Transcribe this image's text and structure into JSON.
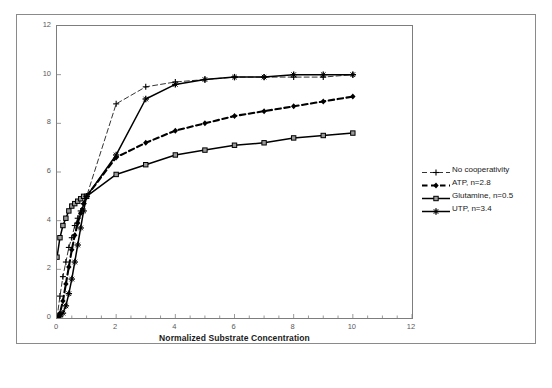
{
  "chart_data": {
    "type": "line",
    "title": "",
    "xlabel": "Normalized Substrate Concentration",
    "ylabel": "",
    "xlim": [
      0,
      12
    ],
    "ylim": [
      0,
      12
    ],
    "xticks": [
      0,
      2,
      4,
      6,
      8,
      10,
      12
    ],
    "yticks": [
      0,
      2,
      4,
      6,
      8,
      10,
      12
    ],
    "xtick_labels": [
      "0",
      "2",
      "4",
      "6",
      "8",
      "10",
      "12"
    ],
    "ytick_labels": [
      "0",
      "2",
      "4",
      "6",
      "8",
      "10",
      "12"
    ],
    "x_minor_tick_step": 0.5,
    "grid": false,
    "legend_position": "right",
    "series": [
      {
        "name": "No cooperativity",
        "hill_n": 1,
        "style": "dashed-thin",
        "marker": "plus",
        "color": "#000000",
        "x": [
          0,
          0.1,
          0.2,
          0.3,
          0.4,
          0.5,
          0.6,
          0.7,
          0.8,
          0.9,
          1,
          2,
          3,
          4,
          5,
          6,
          7,
          8,
          9,
          10
        ],
        "y": [
          0,
          0.9,
          1.7,
          2.3,
          2.9,
          3.3,
          3.8,
          4.1,
          4.4,
          4.7,
          5,
          8.8,
          9.5,
          9.7,
          9.8,
          9.9,
          9.9,
          9.9,
          9.9,
          10
        ]
      },
      {
        "name": "ATP, n=2.8",
        "hill_n": 2.8,
        "style": "dashed-thick",
        "marker": "diamond",
        "color": "#000000",
        "x": [
          0,
          0.1,
          0.2,
          0.3,
          0.4,
          0.5,
          0.6,
          0.7,
          0.8,
          0.9,
          1,
          2,
          3,
          4,
          5,
          6,
          7,
          8,
          9,
          10
        ],
        "y": [
          0,
          0.2,
          0.7,
          1.4,
          2.1,
          2.8,
          3.4,
          3.9,
          4.3,
          4.7,
          5,
          6.6,
          7.2,
          7.7,
          8.0,
          8.3,
          8.5,
          8.7,
          8.9,
          9.1
        ]
      },
      {
        "name": "Glutamine, n=0.5",
        "hill_n": 0.5,
        "style": "solid",
        "marker": "square",
        "color": "#000000",
        "x": [
          0,
          0.1,
          0.2,
          0.3,
          0.4,
          0.5,
          0.6,
          0.7,
          0.8,
          0.9,
          1,
          2,
          3,
          4,
          5,
          6,
          7,
          8,
          9,
          10
        ],
        "y": [
          2.5,
          3.3,
          3.8,
          4.1,
          4.4,
          4.6,
          4.7,
          4.8,
          4.9,
          5.0,
          5.0,
          5.9,
          6.3,
          6.7,
          6.9,
          7.1,
          7.2,
          7.4,
          7.5,
          7.6
        ]
      },
      {
        "name": "UTP, n=3.4",
        "hill_n": 3.4,
        "style": "solid",
        "marker": "star",
        "color": "#000000",
        "x": [
          0,
          0.1,
          0.2,
          0.3,
          0.4,
          0.5,
          0.6,
          0.7,
          0.8,
          0.9,
          1,
          2,
          3,
          4,
          5,
          6,
          7,
          8,
          9,
          10
        ],
        "y": [
          0,
          0.05,
          0.2,
          0.5,
          1.0,
          1.6,
          2.3,
          3.0,
          3.7,
          4.4,
          5.0,
          6.7,
          9.0,
          9.6,
          9.8,
          9.9,
          9.9,
          10.0,
          10.0,
          10.0
        ]
      }
    ]
  },
  "legend": {
    "items": [
      {
        "label": "No cooperativity"
      },
      {
        "label": "ATP, n=2.8"
      },
      {
        "label": "Glutamine, n=0.5"
      },
      {
        "label": "UTP, n=3.4"
      }
    ]
  }
}
